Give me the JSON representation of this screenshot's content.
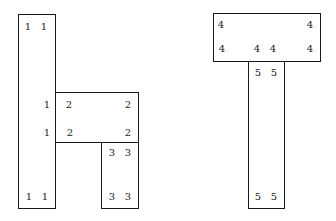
{
  "diagram": {
    "background": "#ffffff",
    "stroke": "#1a1a1a",
    "left_figure": {
      "rects": [
        {
          "id": 1,
          "x": 18,
          "y": 14,
          "w": 38,
          "h": 195
        },
        {
          "id": 2,
          "x": 55,
          "y": 92,
          "w": 84,
          "h": 51
        },
        {
          "id": 3,
          "x": 101,
          "y": 142,
          "w": 38,
          "h": 67
        }
      ],
      "labels": [
        {
          "text": "1",
          "x": 28,
          "y": 27
        },
        {
          "text": "1",
          "x": 44,
          "y": 27
        },
        {
          "text": "1",
          "x": 47,
          "y": 105
        },
        {
          "text": "2",
          "x": 69,
          "y": 105
        },
        {
          "text": "2",
          "x": 128,
          "y": 105
        },
        {
          "text": "1",
          "x": 47,
          "y": 133
        },
        {
          "text": "2",
          "x": 70,
          "y": 133
        },
        {
          "text": "2",
          "x": 128,
          "y": 133
        },
        {
          "text": "3",
          "x": 112,
          "y": 153
        },
        {
          "text": "3",
          "x": 128,
          "y": 153
        },
        {
          "text": "1",
          "x": 29,
          "y": 197
        },
        {
          "text": "1",
          "x": 45,
          "y": 197
        },
        {
          "text": "3",
          "x": 112,
          "y": 197
        },
        {
          "text": "3",
          "x": 128,
          "y": 197
        }
      ]
    },
    "right_figure": {
      "rects": [
        {
          "id": 4,
          "x": 213,
          "y": 13,
          "w": 108,
          "h": 49
        },
        {
          "id": 5,
          "x": 248,
          "y": 61,
          "w": 37,
          "h": 148
        }
      ],
      "labels": [
        {
          "text": "4",
          "x": 221,
          "y": 25
        },
        {
          "text": "4",
          "x": 310,
          "y": 25
        },
        {
          "text": "4",
          "x": 222,
          "y": 49
        },
        {
          "text": "4",
          "x": 257,
          "y": 49
        },
        {
          "text": "4",
          "x": 273,
          "y": 49
        },
        {
          "text": "4",
          "x": 310,
          "y": 49
        },
        {
          "text": "5",
          "x": 258,
          "y": 73
        },
        {
          "text": "5",
          "x": 274,
          "y": 73
        },
        {
          "text": "5",
          "x": 258,
          "y": 197
        },
        {
          "text": "5",
          "x": 274,
          "y": 197
        }
      ]
    }
  }
}
